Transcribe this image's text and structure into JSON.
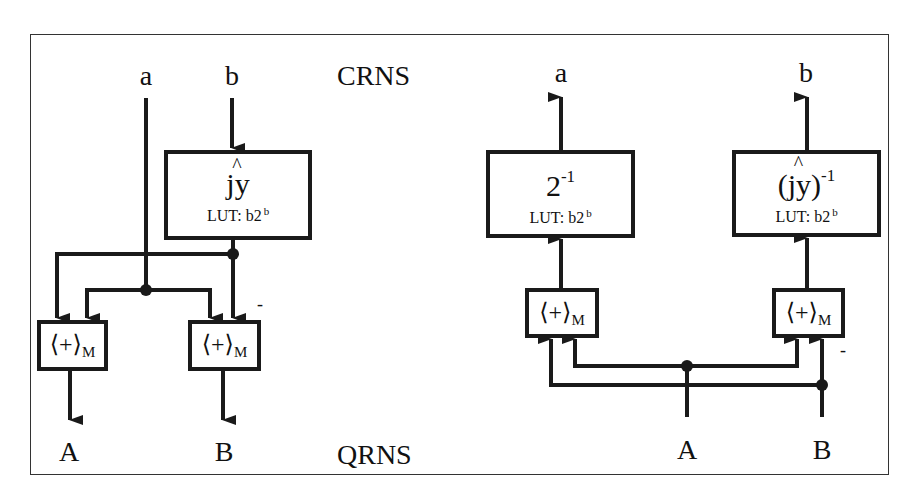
{
  "figure": {
    "region_labels": {
      "top": "CRNS",
      "bottom": "QRNS"
    },
    "left_diagram": {
      "title": "CRNS to QRNS conversion",
      "inputs": [
        "a",
        "b"
      ],
      "outputs": [
        "A",
        "B"
      ],
      "lut": {
        "function": "jy",
        "hat_symbol": "^",
        "table": "LUT: b2",
        "table_exp": "b"
      },
      "adders": [
        {
          "label": "⟨+⟩",
          "subscript": "M"
        },
        {
          "label": "⟨+⟩",
          "subscript": "M",
          "negated_input": "-"
        }
      ]
    },
    "right_diagram": {
      "title": "QRNS to CRNS conversion",
      "inputs": [
        "A",
        "B"
      ],
      "outputs": [
        "a",
        "b"
      ],
      "luts": [
        {
          "function": "2",
          "exponent": "-1",
          "table": "LUT: b2",
          "table_exp": "b"
        },
        {
          "function": "(jy)",
          "hat_symbol": "^",
          "exponent": "-1",
          "table": "LUT: b2",
          "table_exp": "b"
        }
      ],
      "adders": [
        {
          "label": "⟨+⟩",
          "subscript": "M"
        },
        {
          "label": "⟨+⟩",
          "subscript": "M",
          "negated_input": "-"
        }
      ]
    }
  }
}
